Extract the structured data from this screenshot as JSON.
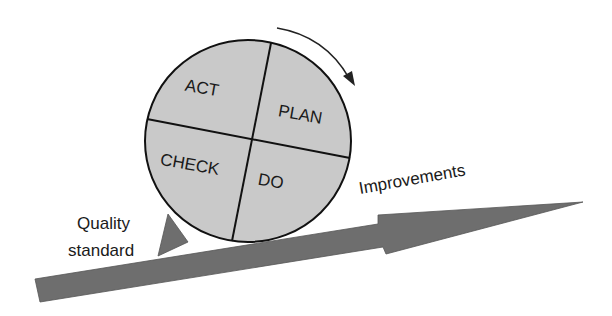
{
  "diagram": {
    "cycle_segments": [
      {
        "label": "ACT",
        "position": "top-left"
      },
      {
        "label": "PLAN",
        "position": "top-right"
      },
      {
        "label": "CHECK",
        "position": "bottom-left"
      },
      {
        "label": "DO",
        "position": "bottom-right"
      }
    ],
    "labels": {
      "improvements": "Improvements",
      "quality_line1": "Quality",
      "quality_line2": "standard"
    },
    "colors": {
      "wheel_fill": "#c9c9c9",
      "arrow_fill": "#6e6e6e",
      "wedge_fill": "#6e6e6e",
      "stroke": "#111111"
    }
  }
}
